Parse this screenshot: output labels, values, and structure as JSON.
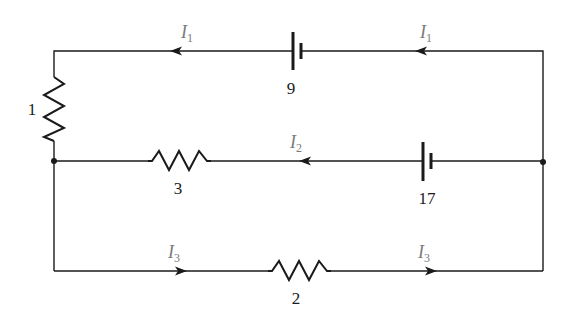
{
  "diagram": {
    "type": "circuit",
    "components": {
      "resistors": [
        {
          "id": "R1",
          "label": "1",
          "branch": "left-vertical"
        },
        {
          "id": "R3",
          "label": "3",
          "branch": "middle"
        },
        {
          "id": "R2",
          "label": "2",
          "branch": "bottom"
        }
      ],
      "batteries": [
        {
          "id": "B9",
          "label": "9",
          "branch": "top"
        },
        {
          "id": "B17",
          "label": "17",
          "branch": "middle"
        }
      ]
    },
    "currents": [
      {
        "id": "I1_left",
        "symbol": "I",
        "sub": "1",
        "branch": "top",
        "direction": "left"
      },
      {
        "id": "I1_right",
        "symbol": "I",
        "sub": "1",
        "branch": "top",
        "direction": "left"
      },
      {
        "id": "I2",
        "symbol": "I",
        "sub": "2",
        "branch": "middle",
        "direction": "left"
      },
      {
        "id": "I3_left",
        "symbol": "I",
        "sub": "3",
        "branch": "bottom",
        "direction": "right"
      },
      {
        "id": "I3_right",
        "symbol": "I",
        "sub": "3",
        "branch": "bottom",
        "direction": "right"
      }
    ],
    "nodes": [
      "left-junction",
      "right-junction"
    ],
    "colors": {
      "wire": "#1a1a1a",
      "current_label": "#7a7a7a"
    }
  }
}
